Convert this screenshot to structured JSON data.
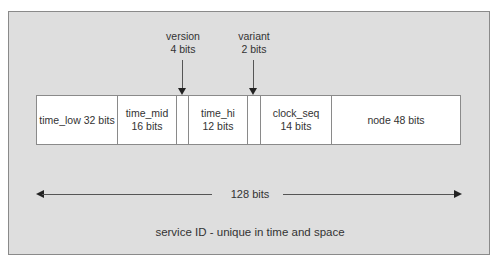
{
  "diagram": {
    "caption": "service ID - unique in time and space",
    "total": {
      "label": "128 bits"
    },
    "annotations": {
      "version": {
        "name": "version",
        "bits": "4 bits"
      },
      "variant": {
        "name": "variant",
        "bits": "2 bits"
      }
    },
    "segments": [
      {
        "id": "time_low",
        "text": "time_low 32 bits",
        "width": 81
      },
      {
        "id": "time_mid",
        "text": "time_mid\n16 bits",
        "width": 59
      },
      {
        "id": "version_slot",
        "text": "",
        "width": 12
      },
      {
        "id": "time_hi",
        "text": "time_hi\n12 bits",
        "width": 59
      },
      {
        "id": "variant_slot",
        "text": "",
        "width": 13
      },
      {
        "id": "clock_seq",
        "text": "clock_seq\n14 bits",
        "width": 71
      },
      {
        "id": "node",
        "text": "node 48 bits",
        "width": 130
      }
    ],
    "colors": {
      "panel_bg": "#dedede",
      "panel_border": "#8a8a8a",
      "box_bg": "#ffffff",
      "text": "#333333",
      "arrow": "#222222"
    }
  }
}
